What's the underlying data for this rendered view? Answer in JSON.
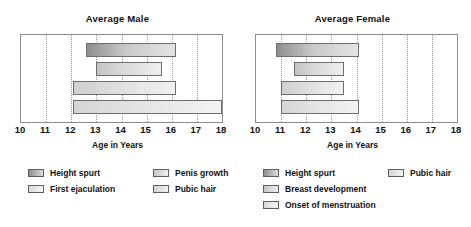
{
  "chart_data": [
    {
      "type": "bar",
      "orientation": "horizontal",
      "title": "Average Male",
      "xlabel": "Age in Years",
      "ylabel": "",
      "xlim": [
        10,
        18
      ],
      "xticks": [
        10,
        11,
        12,
        13,
        14,
        15,
        16,
        17,
        18
      ],
      "grid": true,
      "legend_position": "below",
      "bars": [
        {
          "name": "Height spurt",
          "start": 12.6,
          "end": 16.15,
          "shade": "dark"
        },
        {
          "name": "Penis growth",
          "start": 13.0,
          "end": 15.6,
          "shade": "light"
        },
        {
          "name": "Pubic hair",
          "start": 12.05,
          "end": 16.15,
          "shade": "lighter"
        },
        {
          "name": "First ejaculation",
          "start": 12.05,
          "end": 18.0,
          "shade": "lightest"
        }
      ]
    },
    {
      "type": "bar",
      "orientation": "horizontal",
      "title": "Average Female",
      "xlabel": "Age in Years",
      "ylabel": "",
      "xlim": [
        10,
        18
      ],
      "xticks": [
        10,
        11,
        12,
        13,
        14,
        15,
        16,
        17,
        18
      ],
      "grid": true,
      "legend_position": "below",
      "bars": [
        {
          "name": "Height spurt",
          "start": 10.8,
          "end": 14.1,
          "shade": "dark"
        },
        {
          "name": "Breast development",
          "start": 11.5,
          "end": 13.5,
          "shade": "light"
        },
        {
          "name": "Pubic hair",
          "start": 11.0,
          "end": 13.5,
          "shade": "lighter"
        },
        {
          "name": "Onset of menstruation",
          "start": 11.0,
          "end": 14.1,
          "shade": "lightest"
        }
      ]
    }
  ],
  "male": {
    "title": "Average Male",
    "axis_label": "Age in Years",
    "ticks": [
      "10",
      "11",
      "12",
      "13",
      "14",
      "15",
      "16",
      "17",
      "18"
    ],
    "legend": {
      "col_a": [
        {
          "label": "Height spurt"
        },
        {
          "label": "First ejaculation"
        }
      ],
      "col_b": [
        {
          "label": "Penis growth"
        },
        {
          "label": "Pubic hair"
        }
      ]
    }
  },
  "female": {
    "title": "Average Female",
    "axis_label": "Age in Years",
    "ticks": [
      "10",
      "11",
      "12",
      "13",
      "14",
      "15",
      "16",
      "17",
      "18"
    ],
    "legend": {
      "col_a": [
        {
          "label": "Height spurt"
        },
        {
          "label": "Breast development"
        },
        {
          "label": "Onset of menstruation"
        }
      ],
      "col_b": [
        {
          "label": "Pubic hair"
        }
      ]
    }
  },
  "colors": {
    "axis": "#8d8d8d",
    "grid": "#9a9a9a",
    "bar_border": "#6e6e6e",
    "text": "#111111",
    "background": "#ffffff"
  }
}
